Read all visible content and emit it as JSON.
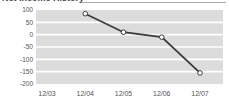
{
  "chart_data": {
    "type": "line",
    "title": "Net Income History",
    "categories": [
      "12/03",
      "12/04",
      "12/05",
      "12/06",
      "12/07"
    ],
    "values": [
      null,
      85,
      10,
      -10,
      -155
    ],
    "xlabel": "",
    "ylabel": "",
    "ylim": [
      -200,
      100
    ],
    "yticks": [
      100,
      50,
      0,
      -50,
      -100,
      -150,
      -200
    ],
    "ytick_labels": [
      "100",
      "50",
      "0",
      "-50",
      "-100",
      "-150",
      "-200"
    ],
    "grid": "horizontal-white-lines-on-gray-bands",
    "legend": "none",
    "colors": {
      "line": "#3a3a3a",
      "marker_fill": "#ffffff",
      "marker_stroke": "#3a3a3a",
      "plot_band": "#dcdcdc",
      "gridline": "#ffffff",
      "tick_text": "#555555",
      "title_text": "#444444",
      "background": "#ffffff"
    }
  }
}
